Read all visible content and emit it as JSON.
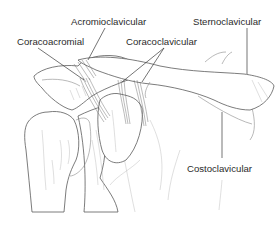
{
  "diagram": {
    "labels": [
      {
        "id": "acromioclavicular",
        "text": "Acromioclavicular",
        "x": 71,
        "y": 17
      },
      {
        "id": "sternoclavicular",
        "text": "Sternoclavicular",
        "x": 193,
        "y": 17
      },
      {
        "id": "coracoacromial",
        "text": "Coracoacromial",
        "x": 17,
        "y": 37
      },
      {
        "id": "coracoclavicular",
        "text": "Coracoclavicular",
        "x": 126,
        "y": 37
      },
      {
        "id": "costoclavicular",
        "text": "Costoclavicular",
        "x": 187,
        "y": 164
      }
    ],
    "colors": {
      "background": "#ffffff",
      "line": "#5a5a5a",
      "text": "#2b2b2b"
    }
  }
}
